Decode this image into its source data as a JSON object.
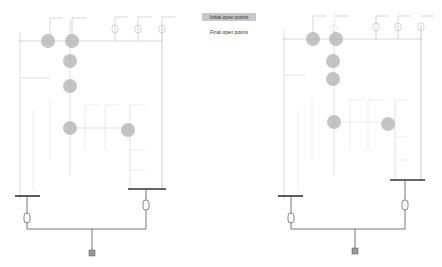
{
  "legend": {
    "initial_label": "Initial open points",
    "final_label": "Final open points",
    "initial_color": "#c8c8c8",
    "final_color": "#ffffff"
  },
  "colors": {
    "line": "#bbbbbb",
    "faint_line": "#dddddd",
    "bus": "#333333",
    "feeder": "#555555",
    "open_point": "#b0b0b0"
  },
  "diagrams": [
    {
      "name": "initial",
      "open_points": [
        {
          "x": 48,
          "y": 41
        },
        {
          "x": 72,
          "y": 41
        },
        {
          "x": 70,
          "y": 61
        },
        {
          "x": 70,
          "y": 86
        },
        {
          "x": 70,
          "y": 128
        },
        {
          "x": 128,
          "y": 130
        }
      ]
    },
    {
      "name": "final",
      "open_points": [
        {
          "x": 313,
          "y": 39
        },
        {
          "x": 336,
          "y": 39
        },
        {
          "x": 333,
          "y": 61
        },
        {
          "x": 333,
          "y": 79
        },
        {
          "x": 334,
          "y": 122
        },
        {
          "x": 388,
          "y": 124
        }
      ]
    }
  ]
}
